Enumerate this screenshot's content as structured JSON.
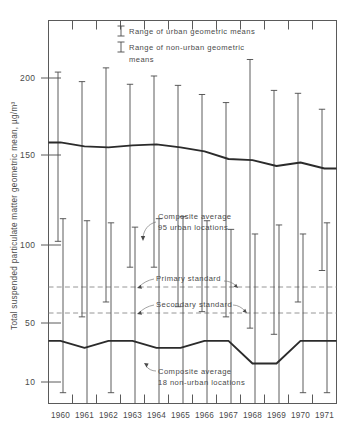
{
  "chart_data": {
    "type": "line",
    "title": "",
    "xlabel": "",
    "ylabel": "Total suspended particulate matter geometric mean, µg/m³",
    "yscale": "log",
    "ylim": [
      8,
      240
    ],
    "ytick_labels": [
      "200",
      "150",
      "100",
      "50",
      "10"
    ],
    "ytick_values": [
      200,
      150,
      100,
      50,
      10
    ],
    "categories": [
      "1960",
      "1961",
      "1962",
      "1963",
      "1964",
      "1965",
      "1966",
      "1967",
      "1968",
      "1969",
      "1970",
      "1971"
    ],
    "grid": false,
    "legend_position": "top-center",
    "legend": [
      {
        "key": "urban-range",
        "label": "Range of urban geometric means"
      },
      {
        "key": "nonurban-range",
        "label": "Range of non-urban geometric means"
      }
    ],
    "series": [
      {
        "name": "Composite average 95 urban locations",
        "key": "urban_average",
        "values": [
          106,
          102,
          101,
          103,
          104,
          101,
          97,
          90,
          89,
          84,
          87,
          82
        ]
      },
      {
        "name": "Composite average 18 non-urban locations",
        "key": "nonurban_average",
        "values": [
          15,
          14,
          15,
          15,
          14,
          14,
          15,
          15,
          12,
          12,
          15,
          15
        ]
      }
    ],
    "ranges": [
      {
        "key": "urban-range",
        "name": "Range of urban geometric means",
        "low": [
          40,
          19,
          22,
          31,
          31,
          21,
          20,
          19,
          17,
          16,
          22,
          30
        ],
        "high": [
          212,
          193,
          221,
          188,
          204,
          186,
          170,
          157,
          240,
          177,
          172,
          147
        ]
      },
      {
        "key": "nonurban-range",
        "name": "Range of non-urban geometric means",
        "low": [
          9,
          8,
          9,
          8,
          8,
          8,
          8,
          8,
          8,
          8,
          9,
          9
        ],
        "high": [
          50,
          49,
          48,
          46,
          50,
          51,
          49,
          45,
          43,
          47,
          43,
          48
        ]
      }
    ],
    "reference_lines": [
      {
        "key": "primary",
        "label": "Primary standard",
        "value": 75
      },
      {
        "key": "secondary",
        "label": "Secondary standard",
        "value": 60
      }
    ],
    "annotations": [
      {
        "key": "urban-annotation",
        "line1": "Composite average",
        "line2": "95 urban locations"
      },
      {
        "key": "nonurban-annotation",
        "line1": "Composite average",
        "line2": "18 non-urban locations"
      }
    ],
    "colors": {
      "line": "#2b2b2b",
      "bar": "#4a4a4a",
      "reference": "#8a8a8a",
      "axis": "#5a5a5a",
      "text": "#4a4a4a",
      "background": "#ffffff"
    }
  }
}
